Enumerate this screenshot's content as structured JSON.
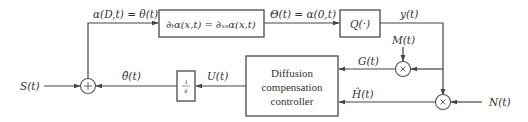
{
  "diagram": {
    "type": "block-diagram",
    "colors": {
      "line": "#444444",
      "text": "#333333",
      "background": "#ffffff"
    },
    "blocks": {
      "pde": {
        "label": "∂ₜα(x,t) = ∂ₓₓα(x,t)"
      },
      "quantizer": {
        "label": "Q(·)"
      },
      "integrator": {
        "numerator": "1",
        "denominator": "s"
      },
      "controller": {
        "line1": "Diffusion",
        "line2": "compensation",
        "line3": "controller"
      }
    },
    "junctions": {
      "sum": {
        "symbol": "+"
      },
      "mult_g": {
        "symbol": "×"
      },
      "mult_h": {
        "symbol": "×"
      }
    },
    "signals": {
      "input_s": "S(t)",
      "boundary": "α(D,t) = θ(t)",
      "output_theta": "Θ(t) = α(0,t)",
      "quantized_y": "y(t)",
      "dither_m": "M(t)",
      "signal_g": "G(t)",
      "noise_n": "N(t)",
      "signal_h": "Ĥ(t)",
      "control_u": "U(t)",
      "estimate_theta": "θ̂(t)"
    }
  }
}
